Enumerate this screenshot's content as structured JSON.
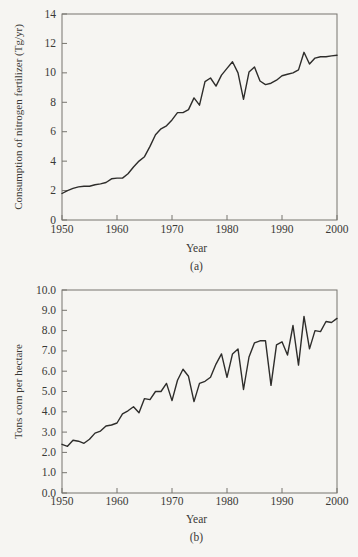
{
  "page": {
    "background": "#f6f5f2",
    "frame_color": "#77756f",
    "line_color": "#2e2d2b",
    "text_color": "#3a3936"
  },
  "chart_data": [
    {
      "id": "a",
      "type": "line",
      "caption": "(a)",
      "xlabel": "Year",
      "ylabel": "Consumption of nitrogen fertilizer (Tg/yr)",
      "xlim": [
        1950,
        2000
      ],
      "ylim": [
        0,
        14
      ],
      "grid": false,
      "legend": "none",
      "xtick_labels": [
        "1950",
        "1960",
        "1970",
        "1980",
        "1990",
        "2000"
      ],
      "xticks": [
        1950,
        1960,
        1970,
        1980,
        1990,
        2000
      ],
      "ytick_labels": [
        "0",
        "2",
        "4",
        "6",
        "8",
        "10",
        "12",
        "14"
      ],
      "yticks": [
        0,
        2,
        4,
        6,
        8,
        10,
        12,
        14
      ],
      "x": [
        1950,
        1951,
        1952,
        1953,
        1954,
        1955,
        1956,
        1957,
        1958,
        1959,
        1960,
        1961,
        1962,
        1963,
        1964,
        1965,
        1966,
        1967,
        1968,
        1969,
        1970,
        1971,
        1972,
        1973,
        1974,
        1975,
        1976,
        1977,
        1978,
        1979,
        1980,
        1981,
        1982,
        1983,
        1984,
        1985,
        1986,
        1987,
        1988,
        1989,
        1990,
        1991,
        1992,
        1993,
        1994,
        1995,
        1996,
        1997,
        1998,
        1999,
        2000
      ],
      "values": [
        1.8,
        2.0,
        2.15,
        2.25,
        2.3,
        2.3,
        2.4,
        2.45,
        2.55,
        2.8,
        2.85,
        2.85,
        3.15,
        3.6,
        4.0,
        4.3,
        5.0,
        5.8,
        6.2,
        6.4,
        6.8,
        7.3,
        7.3,
        7.5,
        8.3,
        7.8,
        9.4,
        9.65,
        9.1,
        9.85,
        10.3,
        10.75,
        10.0,
        8.2,
        10.05,
        10.4,
        9.45,
        9.2,
        9.3,
        9.5,
        9.8,
        9.9,
        10.0,
        10.2,
        11.4,
        10.6,
        11.0,
        11.1,
        11.1,
        11.15,
        11.2
      ]
    },
    {
      "id": "b",
      "type": "line",
      "caption": "(b)",
      "xlabel": "Year",
      "ylabel": "Tons corn per hectare",
      "xlim": [
        1950,
        2000
      ],
      "ylim": [
        0,
        10
      ],
      "grid": false,
      "legend": "none",
      "xtick_labels": [
        "1950",
        "1960",
        "1970",
        "1980",
        "1990",
        "2000"
      ],
      "xticks": [
        1950,
        1960,
        1970,
        1980,
        1990,
        2000
      ],
      "ytick_labels": [
        "0.0",
        "1.0",
        "2.0",
        "3.0",
        "4.0",
        "5.0",
        "6.0",
        "7.0",
        "8.0",
        "9.0",
        "10.0"
      ],
      "yticks": [
        0,
        1,
        2,
        3,
        4,
        5,
        6,
        7,
        8,
        9,
        10
      ],
      "x": [
        1950,
        1951,
        1952,
        1953,
        1954,
        1955,
        1956,
        1957,
        1958,
        1959,
        1960,
        1961,
        1962,
        1963,
        1964,
        1965,
        1966,
        1967,
        1968,
        1969,
        1970,
        1971,
        1972,
        1973,
        1974,
        1975,
        1976,
        1977,
        1978,
        1979,
        1980,
        1981,
        1982,
        1983,
        1984,
        1985,
        1986,
        1987,
        1988,
        1989,
        1990,
        1991,
        1992,
        1993,
        1994,
        1995,
        1996,
        1997,
        1998,
        1999,
        2000
      ],
      "values": [
        2.4,
        2.3,
        2.6,
        2.55,
        2.45,
        2.65,
        2.95,
        3.05,
        3.3,
        3.35,
        3.45,
        3.9,
        4.05,
        4.25,
        3.95,
        4.65,
        4.6,
        5.0,
        5.0,
        5.4,
        4.55,
        5.55,
        6.1,
        5.75,
        4.5,
        5.4,
        5.5,
        5.7,
        6.35,
        6.85,
        5.7,
        6.85,
        7.1,
        5.1,
        6.7,
        7.4,
        7.5,
        7.5,
        5.3,
        7.3,
        7.45,
        6.8,
        8.25,
        6.3,
        8.7,
        7.1,
        8.0,
        7.95,
        8.45,
        8.4,
        8.6
      ]
    }
  ]
}
